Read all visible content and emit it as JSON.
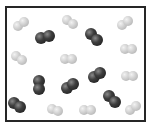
{
  "diagram": {
    "box": {
      "border_color": "#262626",
      "background": "#ffffff"
    },
    "legend": [],
    "molecule_types": {
      "light": {
        "color": "#c8c8c8",
        "count": 10
      },
      "dark": {
        "color": "#2a2a2a",
        "count": 7
      }
    },
    "molecules": [
      {
        "type": "light",
        "x": 21,
        "y": 24,
        "angle": -35
      },
      {
        "type": "light",
        "x": 70,
        "y": 22,
        "angle": 30
      },
      {
        "type": "light",
        "x": 125,
        "y": 23,
        "angle": -35
      },
      {
        "type": "light",
        "x": 19,
        "y": 58,
        "angle": 35
      },
      {
        "type": "light",
        "x": 68,
        "y": 59,
        "angle": 0
      },
      {
        "type": "light",
        "x": 128,
        "y": 49,
        "angle": 0
      },
      {
        "type": "light",
        "x": 129,
        "y": 76,
        "angle": 0
      },
      {
        "type": "light",
        "x": 55,
        "y": 110,
        "angle": 25
      },
      {
        "type": "light",
        "x": 87,
        "y": 110,
        "angle": 0
      },
      {
        "type": "light",
        "x": 133,
        "y": 108,
        "angle": -40
      },
      {
        "type": "dark",
        "x": 45,
        "y": 37,
        "angle": -20
      },
      {
        "type": "dark",
        "x": 94,
        "y": 37,
        "angle": 50
      },
      {
        "type": "dark",
        "x": 39,
        "y": 85,
        "angle": 90
      },
      {
        "type": "dark",
        "x": 70,
        "y": 86,
        "angle": -35
      },
      {
        "type": "dark",
        "x": 97,
        "y": 75,
        "angle": -35
      },
      {
        "type": "dark",
        "x": 112,
        "y": 99,
        "angle": 50
      },
      {
        "type": "dark",
        "x": 17,
        "y": 105,
        "angle": 35
      }
    ]
  }
}
